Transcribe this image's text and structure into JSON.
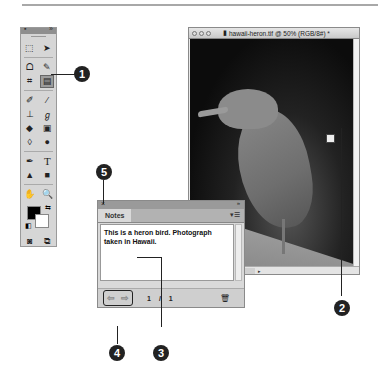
{
  "document": {
    "title": "hawaii-heron.tif @ 50% (RGB/8#) *",
    "status": "Doc: 2.15M/2.15M"
  },
  "toolbox": {
    "tools": [
      [
        "marquee",
        "move"
      ],
      [
        "lasso",
        "quick-select"
      ],
      [
        "crop",
        "note"
      ],
      [
        "healing-brush",
        "brush"
      ],
      [
        "clone-stamp",
        "history-brush"
      ],
      [
        "eraser",
        "gradient"
      ],
      [
        "blur",
        "dodge"
      ],
      [
        "pen",
        "type"
      ],
      [
        "path-select",
        "shape"
      ],
      [
        "hand",
        "zoom"
      ]
    ],
    "foreground_color": "#000000",
    "background_color": "#ffffff"
  },
  "notes_panel": {
    "tab_label": "Notes",
    "text": "This is a heron bird. Photograph taken in Hawaii.",
    "current_page": "1",
    "separator": "/",
    "total_pages": "1",
    "close_glyph": "×",
    "collapse_glyph": "»",
    "menu_glyph": "▾☰",
    "prev_glyph": "⇦",
    "next_glyph": "⇨",
    "delete_glyph": "🗑"
  },
  "callouts": [
    "1",
    "2",
    "3",
    "4",
    "5"
  ]
}
